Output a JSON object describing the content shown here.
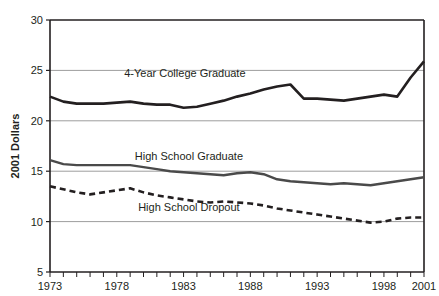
{
  "chart_data": {
    "type": "line",
    "title": "",
    "subtitle": "",
    "xlabel": "",
    "ylabel": "2001 Dollars",
    "xlim": [
      1973,
      2001
    ],
    "ylim": [
      5,
      30
    ],
    "grid": true,
    "grid_axis": "y",
    "legend_position": "inline-annotation",
    "x_tick_labels": [
      "1973",
      "1978",
      "1983",
      "1988",
      "1993",
      "1998",
      "2001"
    ],
    "x_tick_values": [
      1973,
      1978,
      1983,
      1988,
      1993,
      1998,
      2001
    ],
    "x_minor_ticks_every": 1,
    "y_tick_labels": [
      "5",
      "10",
      "15",
      "20",
      "25",
      "30"
    ],
    "y_tick_values": [
      5,
      10,
      15,
      20,
      25,
      30
    ],
    "x": [
      1973,
      1974,
      1975,
      1976,
      1977,
      1978,
      1979,
      1980,
      1981,
      1982,
      1983,
      1984,
      1985,
      1986,
      1987,
      1988,
      1989,
      1990,
      1991,
      1992,
      1993,
      1994,
      1995,
      1996,
      1997,
      1998,
      1999,
      2000,
      2001
    ],
    "series": [
      {
        "name": "4-Year College Graduate",
        "color": "#231f20",
        "style": "solid",
        "width": 2.6,
        "label_x": 1983.1,
        "label_y": 24.3,
        "values": [
          22.4,
          21.9,
          21.7,
          21.7,
          21.7,
          21.8,
          21.9,
          21.7,
          21.6,
          21.6,
          21.3,
          21.4,
          21.7,
          22.0,
          22.4,
          22.7,
          23.1,
          23.4,
          23.6,
          22.2,
          22.2,
          22.1,
          22.0,
          22.2,
          22.4,
          22.6,
          22.4,
          24.3,
          25.9
        ]
      },
      {
        "name": "High School Graduate",
        "color": "#4a4a4a",
        "style": "solid",
        "width": 2.4,
        "label_x": 1983.4,
        "label_y": 16.1,
        "values": [
          16.1,
          15.7,
          15.6,
          15.6,
          15.6,
          15.6,
          15.6,
          15.4,
          15.2,
          15.0,
          14.9,
          14.8,
          14.7,
          14.6,
          14.8,
          14.9,
          14.7,
          14.2,
          14.0,
          13.9,
          13.8,
          13.7,
          13.8,
          13.7,
          13.6,
          13.8,
          14.0,
          14.2,
          14.4
        ]
      },
      {
        "name": "High School Dropout",
        "color": "#231f20",
        "style": "dashed",
        "width": 2.6,
        "label_x": 1983.4,
        "label_y": 11.1,
        "values": [
          13.5,
          13.2,
          12.9,
          12.7,
          12.9,
          13.1,
          13.3,
          12.9,
          12.6,
          12.4,
          12.2,
          12.0,
          11.9,
          12.0,
          11.9,
          11.8,
          11.6,
          11.3,
          11.1,
          10.9,
          10.7,
          10.5,
          10.3,
          10.1,
          9.9,
          10.0,
          10.3,
          10.4,
          10.4
        ]
      }
    ]
  },
  "plot_geometry": {
    "left": 50,
    "right": 424,
    "top": 20,
    "bottom": 272
  },
  "colors": {
    "axis": "#231f20",
    "gridline": "#9d9d9d",
    "text": "#231f20",
    "background": "#ffffff"
  }
}
